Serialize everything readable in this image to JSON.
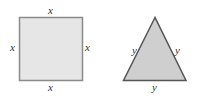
{
  "diagram": {
    "square": {
      "side_labels": {
        "top": "x",
        "left": "x",
        "right": "x",
        "bottom": "x"
      },
      "fill": "#e6e6e6",
      "stroke": "#8a8a8a"
    },
    "triangle": {
      "side_labels": {
        "left": "y",
        "right": "y",
        "bottom": "y"
      },
      "fill": "#cfcfcf",
      "stroke": "#555555"
    }
  }
}
